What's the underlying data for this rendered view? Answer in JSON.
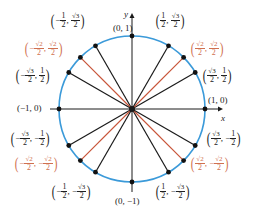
{
  "diagram": {
    "type": "unit-circle",
    "colors": {
      "circle": "#3b9ad9",
      "radius_black": "#1a1a1a",
      "radius_red": "#c8553a",
      "label_black": "#222222",
      "label_red": "#d0704f"
    },
    "axes": {
      "x_label": "x",
      "y_label": "y"
    },
    "center": {
      "cx": 132,
      "cy": 109
    },
    "radius": 73,
    "points": [
      {
        "angle_deg": 0,
        "label": "(1, 0)",
        "color": "black"
      },
      {
        "angle_deg": 30,
        "label": "(√3/2, 1/2)",
        "color": "black"
      },
      {
        "angle_deg": 45,
        "label": "(√2/2, √2/2)",
        "color": "red"
      },
      {
        "angle_deg": 60,
        "label": "(1/2, √3/2)",
        "color": "black"
      },
      {
        "angle_deg": 90,
        "label": "(0, 1)",
        "color": "black"
      },
      {
        "angle_deg": 120,
        "label": "(−1/2, √3/2)",
        "color": "black"
      },
      {
        "angle_deg": 135,
        "label": "(−√2/2, √2/2)",
        "color": "red"
      },
      {
        "angle_deg": 150,
        "label": "(−√3/2, 1/2)",
        "color": "black"
      },
      {
        "angle_deg": 180,
        "label": "(−1, 0)",
        "color": "black"
      },
      {
        "angle_deg": 210,
        "label": "(−√3/2, −1/2)",
        "color": "black"
      },
      {
        "angle_deg": 225,
        "label": "(−√2/2, −√2/2)",
        "color": "red"
      },
      {
        "angle_deg": 240,
        "label": "(−1/2, −√3/2)",
        "color": "black"
      },
      {
        "angle_deg": 270,
        "label": "(0, −1)",
        "color": "black"
      },
      {
        "angle_deg": 300,
        "label": "(1/2, −√3/2)",
        "color": "black"
      },
      {
        "angle_deg": 315,
        "label": "(√2/2, −√2/2)",
        "color": "red"
      },
      {
        "angle_deg": 330,
        "label": "(√3/2, −1/2)",
        "color": "black"
      }
    ],
    "labels": {
      "p0": "(1, 0)",
      "p90": "(0, 1)",
      "p180": "(−1, 0)",
      "p270": "(0, −1)",
      "one": "1",
      "two": "2",
      "sqrt2": "√2",
      "sqrt3": "√3",
      "minus": "−",
      "comma": ","
    }
  }
}
